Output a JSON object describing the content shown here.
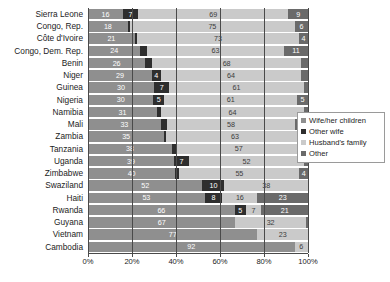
{
  "chart_data": {
    "type": "bar",
    "orientation": "horizontal",
    "stacked": true,
    "stack_total": 100,
    "units": "percent",
    "title": "",
    "subtitle": "",
    "xlabel": "",
    "ylabel": "",
    "xlim": [
      0,
      100
    ],
    "xticks": [
      0,
      20,
      40,
      60,
      80,
      100
    ],
    "xtick_labels": [
      "0%",
      "20%",
      "40%",
      "60%",
      "80%",
      "100%"
    ],
    "grid": true,
    "grid_axis": "x",
    "legend_position": "right",
    "categories": [
      "Sierra Leone",
      "Congo, Rep.",
      "Côte d'Ivoire",
      "Congo, Dem. Rep.",
      "Benin",
      "Niger",
      "Guinea",
      "Nigeria",
      "Namibia",
      "Mali",
      "Zambia",
      "Tanzania",
      "Uganda",
      "Zimbabwe",
      "Swaziland",
      "Haiti",
      "Rwanda",
      "Guyana",
      "Vietnam",
      "Cambodia"
    ],
    "series": [
      {
        "name": "Wife/her children",
        "color": "#8f8f8f",
        "values": [
          16,
          18,
          21,
          24,
          26,
          29,
          30,
          30,
          31,
          33,
          35,
          38,
          39,
          40,
          52,
          53,
          66,
          67,
          77,
          92
        ]
      },
      {
        "name": "Other wife",
        "color": "#2e2e2e",
        "values": [
          7,
          1,
          1,
          3,
          3,
          4,
          7,
          5,
          2,
          3,
          1,
          2,
          7,
          2,
          10,
          8,
          5,
          0,
          0,
          0
        ]
      },
      {
        "name": "Husband's family",
        "color": "#cacaca",
        "values": [
          69,
          75,
          73,
          63,
          68,
          64,
          61,
          61,
          64,
          58,
          63,
          57,
          52,
          55,
          38,
          16,
          7,
          32,
          23,
          6
        ]
      },
      {
        "name": "Other",
        "color": "#6a6a6a",
        "values": [
          9,
          6,
          4,
          11,
          3,
          3,
          2,
          5,
          2,
          6,
          2,
          3,
          2,
          4,
          0,
          23,
          21,
          1,
          0,
          0
        ]
      }
    ],
    "legend": [
      {
        "label": "Wife/her children",
        "color": "#8f8f8f"
      },
      {
        "label": "Other wife",
        "color": "#2e2e2e"
      },
      {
        "label": "Husband's family",
        "color": "#cacaca"
      },
      {
        "label": "Other",
        "color": "#6a6a6a"
      }
    ]
  }
}
